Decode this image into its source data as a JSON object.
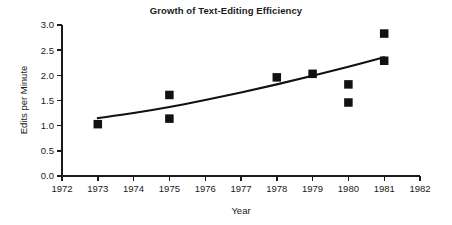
{
  "chart_data": {
    "type": "scatter",
    "title": "Growth of Text-Editing Efficiency",
    "xlabel": "Year",
    "ylabel": "Edits per Minute",
    "xlim": [
      1972,
      1982
    ],
    "ylim": [
      0.0,
      3.0
    ],
    "grid": false,
    "legend": null,
    "xticks": [
      1972,
      1973,
      1974,
      1975,
      1976,
      1977,
      1978,
      1979,
      1980,
      1981,
      1982
    ],
    "xtick_labels": [
      "1972",
      "1973",
      "1974",
      "1975",
      "1976",
      "1977",
      "1978",
      "1979",
      "1980",
      "1981",
      "1982"
    ],
    "yticks": [
      0.0,
      0.5,
      1.0,
      1.5,
      2.0,
      2.5,
      3.0
    ],
    "ytick_labels": [
      "0.0",
      "0.5",
      "1.0",
      "1.5",
      "2.0",
      "2.5",
      "3.0"
    ],
    "marker": "filled-square",
    "marker_color": "#111111",
    "points": [
      {
        "x": 1973,
        "y": 1.03
      },
      {
        "x": 1975,
        "y": 1.61
      },
      {
        "x": 1975,
        "y": 1.14
      },
      {
        "x": 1978,
        "y": 1.96
      },
      {
        "x": 1979,
        "y": 2.03
      },
      {
        "x": 1980,
        "y": 1.82
      },
      {
        "x": 1980,
        "y": 1.46
      },
      {
        "x": 1981,
        "y": 2.83
      },
      {
        "x": 1981,
        "y": 2.29
      }
    ],
    "series": [
      {
        "name": "Edits per Minute",
        "x": [
          1973,
          1975,
          1975,
          1978,
          1979,
          1980,
          1980,
          1981,
          1981
        ],
        "values": [
          1.03,
          1.61,
          1.14,
          1.96,
          2.03,
          1.82,
          1.46,
          2.83,
          2.29
        ]
      }
    ],
    "trend": {
      "name": "fitted-trend-curve",
      "color": "#111111",
      "x": [
        1973.0,
        1974.0,
        1975.0,
        1976.0,
        1977.0,
        1978.0,
        1979.0,
        1980.0,
        1981.0
      ],
      "values": [
        1.15,
        1.25,
        1.37,
        1.51,
        1.66,
        1.82,
        1.99,
        2.17,
        2.36
      ]
    }
  }
}
